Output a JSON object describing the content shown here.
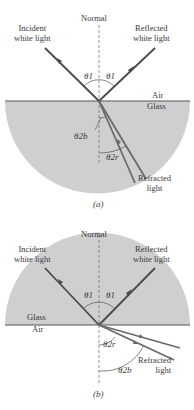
{
  "figure_a": {
    "normal": "Normal",
    "incident": [
      "Incident",
      "white light"
    ],
    "reflected": [
      "Reflected",
      "white light"
    ],
    "upper_medium": "Air",
    "lower_medium": "Glass",
    "theta_incident": "θ1",
    "theta_reflected": "θ1",
    "theta_blue": "θ2b",
    "theta_red": "θ2r",
    "refracted": [
      "Refracted",
      "light"
    ],
    "caption": "(a)"
  },
  "figure_b": {
    "normal": "Normal",
    "incident": [
      "Incident",
      "white light"
    ],
    "reflected": [
      "Reflected",
      "white light"
    ],
    "upper_medium": "Glass",
    "lower_medium": "Air",
    "theta_incident": "θ1",
    "theta_reflected": "θ1",
    "theta_red": "θ2r",
    "theta_blue": "θ2b",
    "refracted": [
      "Refracted",
      "light"
    ],
    "caption": "(b)"
  },
  "colors": {
    "glass": "#cfcfcf",
    "ray": "#4a4a4a",
    "ray_refracted": "#6a6a6a",
    "normal_line": "#777777"
  }
}
